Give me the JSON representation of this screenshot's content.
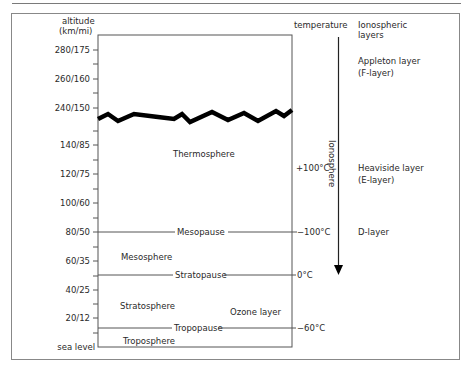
{
  "header": {
    "altitude_label_line1": "altitude",
    "altitude_label_line2": "(km/mi)",
    "temperature_label": "temperature",
    "ionospheric_label_line1": "Ionospheric",
    "ionospheric_label_line2": "layers"
  },
  "altitude_ticks": [
    {
      "label": "280/175",
      "y": 50
    },
    {
      "label": "260/160",
      "y": 79
    },
    {
      "label": "240/150",
      "y": 108
    },
    {
      "label": "140/85",
      "y": 145
    },
    {
      "label": "120/75",
      "y": 174
    },
    {
      "label": "100/60",
      "y": 203
    },
    {
      "label": "80/50",
      "y": 232
    },
    {
      "label": "60/35",
      "y": 261
    },
    {
      "label": "40/25",
      "y": 290
    },
    {
      "label": "20/12",
      "y": 318
    },
    {
      "label": "sea level",
      "y": 347
    }
  ],
  "layers": {
    "thermosphere": "Thermosphere",
    "mesosphere": "Mesosphere",
    "stratosphere": "Stratosphere",
    "troposphere": "Troposphere",
    "ozone": "Ozone layer"
  },
  "boundaries": {
    "mesopause": "Mesopause",
    "stratopause": "Stratopause",
    "tropopause": "Tropopause"
  },
  "temperatures": {
    "thermo": "+100°C",
    "mesopause": "−100°C",
    "stratopause": "0°C",
    "tropopause": "−60°C"
  },
  "ionosphere": {
    "label": "Ionosphere",
    "appleton_line1": "Appleton layer",
    "appleton_line2": "(F-layer)",
    "heaviside_line1": "Heaviside layer",
    "heaviside_line2": "(E-layer)",
    "d_layer": "D-layer"
  },
  "colors": {
    "line": "#555555",
    "break": "#000000",
    "text": "#2a2a2a"
  }
}
